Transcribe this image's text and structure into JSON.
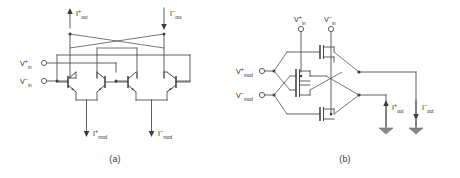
{
  "figure": {
    "background_color": "#ffffff",
    "line_color": "#454545",
    "text_color": "#2e2e2e",
    "width": 460,
    "height": 178
  },
  "panels": [
    {
      "id": "a",
      "caption": "(a)",
      "technology": "bipolar",
      "description": "Gilbert cell multiplier with bipolar junction transistors",
      "inputs": [
        {
          "name": "v-in-plus",
          "base": "V",
          "sup": "+",
          "sub": "in"
        },
        {
          "name": "v-in-minus",
          "base": "V",
          "sup": "−",
          "sub": "in"
        }
      ],
      "top_currents": [
        {
          "name": "i-out-plus",
          "base": "I",
          "sup": "+",
          "sub": "out",
          "direction": "up"
        },
        {
          "name": "i-out-minus",
          "base": "I",
          "sup": "−",
          "sub": "out",
          "direction": "down"
        }
      ],
      "bottom_currents": [
        {
          "name": "i-mod-plus",
          "base": "I",
          "sup": "+",
          "sub": "mod",
          "direction": "down"
        },
        {
          "name": "i-mod-minus",
          "base": "I",
          "sup": "−",
          "sub": "mod",
          "direction": "down"
        }
      ],
      "transistor_count": 4
    },
    {
      "id": "b",
      "caption": "(b)",
      "technology": "cmos",
      "description": "Gilbert cell multiplier with MOS transistors",
      "inputs": [
        {
          "name": "v-in-plus",
          "base": "V",
          "sup": "+",
          "sub": "in"
        },
        {
          "name": "v-in-minus",
          "base": "V",
          "sup": "−",
          "sub": "in"
        }
      ],
      "mod_inputs": [
        {
          "name": "v-mod-plus",
          "base": "V",
          "sup": "+",
          "sub": "mod"
        },
        {
          "name": "v-mod-minus",
          "base": "V",
          "sup": "−",
          "sub": "mod"
        }
      ],
      "output_currents": [
        {
          "name": "i-out-plus",
          "base": "I",
          "sup": "+",
          "sub": "out",
          "direction": "up"
        },
        {
          "name": "i-out-minus",
          "base": "I",
          "sup": "−",
          "sub": "out",
          "direction": "down"
        }
      ],
      "ground_count": 2,
      "transistor_count": 4
    }
  ]
}
